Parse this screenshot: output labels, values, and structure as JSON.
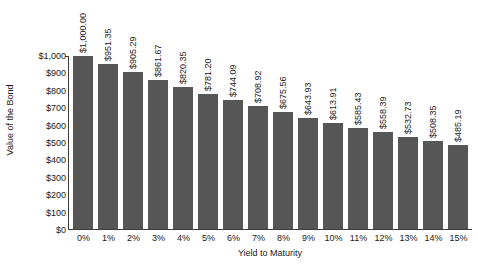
{
  "chart_data": {
    "type": "bar",
    "title": "",
    "xlabel": "Yield to Maturity",
    "ylabel": "Value of the Bond",
    "categories": [
      "0%",
      "1%",
      "2%",
      "3%",
      "4%",
      "5%",
      "6%",
      "7%",
      "8%",
      "9%",
      "10%",
      "11%",
      "12%",
      "13%",
      "14%",
      "15%"
    ],
    "values": [
      1000.0,
      951.35,
      905.29,
      861.67,
      820.35,
      781.2,
      744.09,
      708.92,
      675.56,
      643.93,
      613.91,
      585.43,
      558.39,
      532.73,
      508.35,
      485.19
    ],
    "data_labels": [
      "$1,000.00",
      "$951.35",
      "$905.29",
      "$861.67",
      "$820.35",
      "$781.20",
      "$744.09",
      "$708.92",
      "$675.56",
      "$643.93",
      "$613.91",
      "$585.43",
      "$558.39",
      "$532.73",
      "$508.35",
      "$485.19"
    ],
    "ylim": [
      0,
      1000
    ],
    "ytick_values": [
      0,
      100,
      200,
      300,
      400,
      500,
      600,
      700,
      800,
      900,
      1000
    ],
    "ytick_labels": [
      "$0",
      "$100",
      "$200",
      "$300",
      "$400",
      "$500",
      "$600",
      "$700",
      "$800",
      "$900",
      "$1,000"
    ],
    "grid": false,
    "legend": "none",
    "bar_color": "#565656",
    "axis_color": "#3c3c3c",
    "background_color": "#ffffff",
    "data_label_rotation": "vertical"
  }
}
